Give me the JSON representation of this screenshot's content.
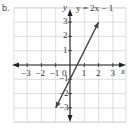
{
  "part_label": "b.",
  "chart_data": {
    "type": "line",
    "title": "",
    "equation": "y = 2x − 1",
    "xlabel": "x",
    "ylabel": "y",
    "xlim": [
      -4,
      4
    ],
    "ylim": [
      -4,
      4
    ],
    "grid": true,
    "x_ticks": [
      -3,
      -2,
      -1,
      1,
      2,
      3
    ],
    "y_ticks": [
      3,
      2,
      1,
      -1,
      -2,
      -3
    ],
    "origin_label": "0",
    "series": [
      {
        "name": "y = 2x − 1",
        "x": [
          -1,
          2
        ],
        "y": [
          -3,
          3
        ],
        "arrows": "both"
      }
    ]
  }
}
